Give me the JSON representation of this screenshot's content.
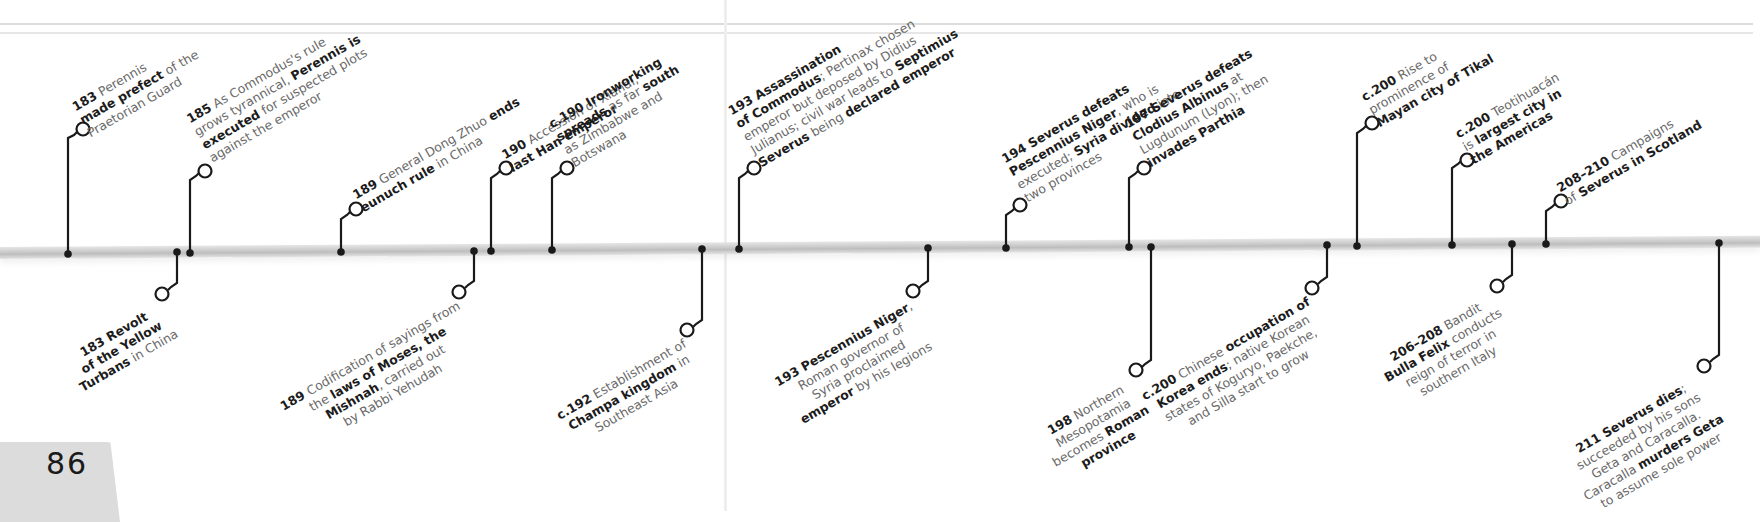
{
  "page": {
    "page_number": "86",
    "bar_color": "#c6c6c6",
    "ink_color": "#1a1a1a",
    "text_color": "#6a6a6a"
  },
  "events_above": [
    {
      "id": "e183-perennis",
      "year": "183",
      "lines": [
        [
          "183",
          "b",
          " Perennis",
          ""
        ],
        [
          "made prefect",
          "b",
          " of the",
          ""
        ],
        [
          "Praetorian Guard",
          ""
        ]
      ]
    },
    {
      "id": "e185-perennis-executed",
      "year": "185",
      "lines": [
        [
          "185",
          "b",
          " As Commodus's rule",
          ""
        ],
        [
          "grows tyrannical, ",
          "",
          "Perennis is",
          "b"
        ],
        [
          "executed",
          "b",
          " for suspected plots",
          ""
        ],
        [
          "against the emperor",
          ""
        ]
      ]
    },
    {
      "id": "e189-dong-zhuo",
      "year": "189",
      "lines": [
        [
          "189",
          "b",
          " General Dong Zhuo ",
          "",
          "ends",
          "b"
        ],
        [
          "eunuch rule",
          "b",
          " in China",
          ""
        ]
      ]
    },
    {
      "id": "e190-xiandi",
      "year": "190",
      "lines": [
        [
          "190",
          "b",
          " Accession of Xiandi,",
          ""
        ],
        [
          "last Han emperor",
          "b"
        ]
      ]
    },
    {
      "id": "ec190-ironworking",
      "year": "c.190",
      "lines": [
        [
          "c.190 Ironworking",
          "b"
        ],
        [
          "spreads",
          "b",
          " as far ",
          "",
          "south",
          "b"
        ],
        [
          "as Zimbabwe and",
          ""
        ],
        [
          "Botswana",
          ""
        ]
      ]
    },
    {
      "id": "e193-assassination",
      "year": "193",
      "lines": [
        [
          "193 Assassination",
          "b"
        ],
        [
          "of Commodus",
          "b",
          "; Pertinax chosen",
          ""
        ],
        [
          "emperor but deposed by Didius",
          ""
        ],
        [
          "Julianus; civil war leads to ",
          "",
          "Septimius",
          "b"
        ],
        [
          "Severus",
          "b",
          " being ",
          "",
          "declared emperor",
          "b"
        ]
      ]
    },
    {
      "id": "e194-severus-niger",
      "year": "194",
      "lines": [
        [
          "194 Severus defeats",
          "b"
        ],
        [
          "Pescennius Niger",
          "b",
          ", who is",
          ""
        ],
        [
          "executed; ",
          "",
          "Syria divided",
          "b",
          " into",
          ""
        ],
        [
          "two provinces",
          ""
        ]
      ]
    },
    {
      "id": "e197-severus-albinus",
      "year": "197",
      "lines": [
        [
          "197 Severus defeats",
          "b"
        ],
        [
          "Clodius Albinus",
          "b",
          " at",
          ""
        ],
        [
          "Lugdunum (Lyon); then",
          ""
        ],
        [
          "invades Parthia",
          "b"
        ]
      ]
    },
    {
      "id": "ec200-tikal",
      "year": "c.200",
      "lines": [
        [
          "c.200",
          "b",
          " Rise to",
          ""
        ],
        [
          "prominence of",
          ""
        ],
        [
          "Mayan city of Tikal",
          "b"
        ]
      ]
    },
    {
      "id": "ec200-teotihuacan",
      "year": "c.200",
      "lines": [
        [
          "c.200",
          "b",
          " Teotihuacán",
          ""
        ],
        [
          "is ",
          "",
          "largest city in",
          "b"
        ],
        [
          "the Americas",
          "b"
        ]
      ]
    },
    {
      "id": "e208-scotland",
      "year": "208–210",
      "lines": [
        [
          "208–210",
          "b",
          " Campaigns",
          ""
        ],
        [
          "of ",
          "",
          "Severus in Scotland",
          "b"
        ]
      ]
    }
  ],
  "events_below": [
    {
      "id": "e183-yellow-turbans",
      "year": "183",
      "lines": [
        [
          "183 Revolt",
          "b"
        ],
        [
          "of the Yellow",
          "b"
        ],
        [
          "Turbans",
          "b",
          " in China",
          ""
        ]
      ]
    },
    {
      "id": "e189-mishnah",
      "year": "189",
      "lines": [
        [
          "Codification of sayings from",
          ""
        ],
        [
          "the ",
          "",
          "laws of Moses, the",
          "b"
        ],
        [
          "Mishnah",
          "b",
          ", carried out",
          ""
        ],
        [
          "by Rabbi Yehudah",
          ""
        ]
      ],
      "prefix": "189"
    },
    {
      "id": "ec192-champa",
      "year": "c.192",
      "lines": [
        [
          "c.192",
          "b",
          " Establishment of",
          ""
        ],
        [
          "Champa kingdom",
          "b",
          " in",
          ""
        ],
        [
          "Southeast Asia",
          ""
        ]
      ]
    },
    {
      "id": "e193-niger",
      "year": "193",
      "lines": [
        [
          "193 Pescennius Niger",
          "b",
          ",",
          ""
        ],
        [
          "Roman governor of",
          ""
        ],
        [
          "Syria proclaimed",
          ""
        ],
        [
          "emperor",
          "b",
          " by his legions",
          ""
        ]
      ]
    },
    {
      "id": "e198-mesopotamia",
      "year": "198",
      "lines": [
        [
          "198",
          "b",
          " Northern",
          ""
        ],
        [
          "Mesopotamia",
          ""
        ],
        [
          "becomes ",
          "",
          "Roman",
          "b"
        ],
        [
          "province",
          "b"
        ]
      ]
    },
    {
      "id": "ec200-korea",
      "year": "c.200",
      "lines": [
        [
          "c.200",
          "b",
          " Chinese ",
          "",
          "occupation of",
          "b"
        ],
        [
          "Korea ends",
          "b",
          "; native Korean",
          ""
        ],
        [
          "states of Koguryo, Paekche,",
          ""
        ],
        [
          "and Silla start to grow",
          ""
        ]
      ]
    },
    {
      "id": "e206-bulla-felix",
      "year": "206–208",
      "lines": [
        [
          "206–208",
          "b",
          " Bandit",
          ""
        ],
        [
          "Bulla Felix",
          "b",
          " conducts",
          ""
        ],
        [
          "reign of terror in",
          ""
        ],
        [
          "southern Italy",
          ""
        ]
      ]
    },
    {
      "id": "e211-severus-dies",
      "year": "211",
      "lines": [
        [
          "211 Severus dies",
          "b",
          ";",
          ""
        ],
        [
          "succeeded by his sons",
          ""
        ],
        [
          "Geta and Caracalla.",
          ""
        ],
        [
          "Caracalla ",
          "",
          "murders Geta",
          "b"
        ],
        [
          "to assume sole power",
          ""
        ]
      ]
    }
  ]
}
